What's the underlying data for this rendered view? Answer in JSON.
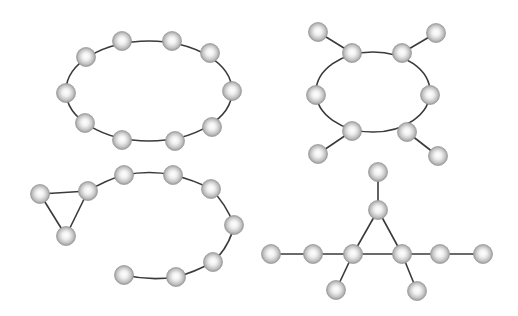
{
  "diagram": {
    "type": "graph-structures",
    "node_radius": 9.5,
    "colors": {
      "background": "#ffffff",
      "edge": "#3a3a3a",
      "node_highlight": "#ffffff",
      "node_mid": "#d2d2d2",
      "node_shadow": "#8e8e8e"
    },
    "graphs": [
      {
        "name": "ring-10",
        "description": "10-node cycle arranged on an ellipse",
        "ellipse": {
          "cx": 149,
          "cy": 91,
          "rx": 83,
          "ry": 50
        },
        "nodes": [
          {
            "x": 122,
            "y": 41
          },
          {
            "x": 172,
            "y": 41
          },
          {
            "x": 210,
            "y": 53
          },
          {
            "x": 232,
            "y": 91
          },
          {
            "x": 212,
            "y": 127
          },
          {
            "x": 175,
            "y": 141
          },
          {
            "x": 122,
            "y": 140
          },
          {
            "x": 85,
            "y": 123
          },
          {
            "x": 66,
            "y": 93
          },
          {
            "x": 86,
            "y": 57
          }
        ],
        "curve_edges": "ellipse",
        "edges": []
      },
      {
        "name": "ring-6-with-4-pendants",
        "description": "6-node cycle with four pendant nodes",
        "ellipse": {
          "cx": 373,
          "cy": 92,
          "rx": 57,
          "ry": 40
        },
        "nodes": [
          {
            "x": 352,
            "y": 53
          },
          {
            "x": 402,
            "y": 53
          },
          {
            "x": 430,
            "y": 95
          },
          {
            "x": 407,
            "y": 132
          },
          {
            "x": 352,
            "y": 131
          },
          {
            "x": 316,
            "y": 95
          },
          {
            "x": 318,
            "y": 32
          },
          {
            "x": 436,
            "y": 33
          },
          {
            "x": 318,
            "y": 154
          },
          {
            "x": 438,
            "y": 156
          }
        ],
        "curve_edges": "ellipse",
        "edges": [
          [
            0,
            6
          ],
          [
            1,
            7
          ],
          [
            4,
            8
          ],
          [
            3,
            9
          ]
        ]
      },
      {
        "name": "triangle-with-tail",
        "description": "Triangle attached to a curved open chain",
        "nodes": [
          {
            "x": 40,
            "y": 194
          },
          {
            "x": 88,
            "y": 191
          },
          {
            "x": 66,
            "y": 236
          },
          {
            "x": 124,
            "y": 175
          },
          {
            "x": 173,
            "y": 175
          },
          {
            "x": 211,
            "y": 189
          },
          {
            "x": 234,
            "y": 225
          },
          {
            "x": 213,
            "y": 262
          },
          {
            "x": 176,
            "y": 277
          },
          {
            "x": 124,
            "y": 275
          }
        ],
        "edges": [
          [
            0,
            1
          ],
          [
            1,
            2
          ],
          [
            2,
            0
          ]
        ],
        "path": "M88,191 Q106,180 124,175 Q150,170 173,175 Q194,180 211,189 Q226,204 234,225 Q230,246 213,262 Q195,272 176,277 Q150,281 124,275"
      },
      {
        "name": "triangle-star",
        "description": "Central triangle with branching arms",
        "nodes": [
          {
            "x": 378,
            "y": 172
          },
          {
            "x": 378,
            "y": 210
          },
          {
            "x": 353,
            "y": 254
          },
          {
            "x": 402,
            "y": 254
          },
          {
            "x": 313,
            "y": 254
          },
          {
            "x": 271,
            "y": 254
          },
          {
            "x": 440,
            "y": 254
          },
          {
            "x": 483,
            "y": 254
          },
          {
            "x": 336,
            "y": 290
          },
          {
            "x": 417,
            "y": 291
          }
        ],
        "edges": [
          [
            0,
            1
          ],
          [
            1,
            2
          ],
          [
            1,
            3
          ],
          [
            2,
            3
          ],
          [
            2,
            4
          ],
          [
            4,
            5
          ],
          [
            3,
            6
          ],
          [
            6,
            7
          ],
          [
            2,
            8
          ],
          [
            3,
            9
          ]
        ]
      }
    ]
  }
}
